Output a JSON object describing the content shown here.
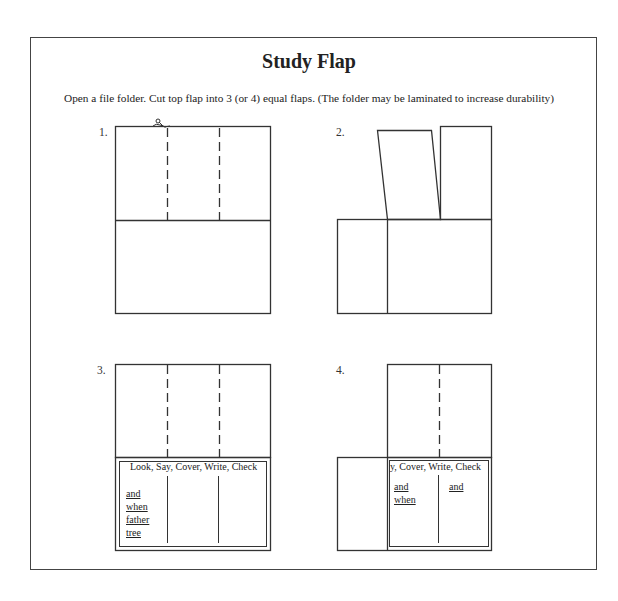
{
  "title": "Study Flap",
  "instructions": "Open a file folder.  Cut top flap into 3 (or 4) equal flaps. (The folder may be laminated to increase durability)",
  "steps": [
    {
      "label": "1.",
      "description": "Folder with top flap marked by two dashed cut lines; scissors at first cut line",
      "icon": "scissors-icon"
    },
    {
      "label": "2.",
      "description": "Left flap lifted and tilted open, right flap standing, revealing left panel of bottom half"
    },
    {
      "label": "3.",
      "header": "Look, Say, Cover, Write, Check",
      "words": [
        "and",
        "when",
        "father",
        "tree"
      ]
    },
    {
      "label": "4.",
      "header": "y, Cover, Write, Check",
      "words_left": [
        "and",
        "when"
      ],
      "words_right": [
        "and"
      ]
    }
  ],
  "colors": {
    "line": "#333333",
    "frame": "#444444",
    "background": "#ffffff"
  }
}
